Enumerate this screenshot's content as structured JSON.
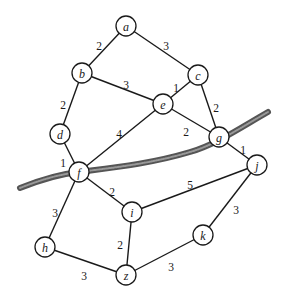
{
  "diagram": {
    "type": "weighted-undirected-graph",
    "nodes": [
      {
        "id": "a",
        "label": "a",
        "x": 126,
        "y": 26
      },
      {
        "id": "b",
        "label": "b",
        "x": 82,
        "y": 73
      },
      {
        "id": "c",
        "label": "c",
        "x": 198,
        "y": 75
      },
      {
        "id": "d",
        "label": "d",
        "x": 60,
        "y": 134
      },
      {
        "id": "e",
        "label": "e",
        "x": 163,
        "y": 104
      },
      {
        "id": "f",
        "label": "f",
        "x": 79,
        "y": 172
      },
      {
        "id": "g",
        "label": "g",
        "x": 219,
        "y": 137
      },
      {
        "id": "h",
        "label": "h",
        "x": 45,
        "y": 247
      },
      {
        "id": "i",
        "label": "i",
        "x": 132,
        "y": 212
      },
      {
        "id": "j",
        "label": "j",
        "x": 257,
        "y": 165
      },
      {
        "id": "k",
        "label": "k",
        "x": 203,
        "y": 235
      },
      {
        "id": "z",
        "label": "z",
        "x": 126,
        "y": 275
      }
    ],
    "edges": [
      {
        "from": "a",
        "to": "b",
        "weight": "2",
        "lx": 99,
        "ly": 46
      },
      {
        "from": "a",
        "to": "c",
        "weight": "3",
        "lx": 166,
        "ly": 46
      },
      {
        "from": "b",
        "to": "e",
        "weight": "3",
        "lx": 126,
        "ly": 85
      },
      {
        "from": "b",
        "to": "d",
        "weight": "2",
        "lx": 63,
        "ly": 105
      },
      {
        "from": "c",
        "to": "e",
        "weight": "1",
        "lx": 176,
        "ly": 88
      },
      {
        "from": "c",
        "to": "g",
        "weight": "2",
        "lx": 216,
        "ly": 108
      },
      {
        "from": "e",
        "to": "g",
        "weight": "2",
        "lx": 186,
        "ly": 132
      },
      {
        "from": "e",
        "to": "f",
        "weight": "4",
        "lx": 119,
        "ly": 134
      },
      {
        "from": "d",
        "to": "f",
        "weight": "1",
        "lx": 63,
        "ly": 163
      },
      {
        "from": "g",
        "to": "j",
        "weight": "1",
        "lx": 243,
        "ly": 150
      },
      {
        "from": "f",
        "to": "i",
        "weight": "2",
        "lx": 112,
        "ly": 192
      },
      {
        "from": "i",
        "to": "j",
        "weight": "5",
        "lx": 190,
        "ly": 185
      },
      {
        "from": "f",
        "to": "h",
        "weight": "3",
        "lx": 55,
        "ly": 213
      },
      {
        "from": "i",
        "to": "z",
        "weight": "2",
        "lx": 120,
        "ly": 245
      },
      {
        "from": "j",
        "to": "k",
        "weight": "3",
        "lx": 236,
        "ly": 210
      },
      {
        "from": "h",
        "to": "z",
        "weight": "3",
        "lx": 84,
        "ly": 276
      },
      {
        "from": "k",
        "to": "z",
        "weight": "3",
        "lx": 171,
        "ly": 267
      }
    ],
    "cut": {
      "path": "M 20 188 C 40 180, 60 174, 79 172 C 110 168, 150 164, 190 152 C 215 145, 240 128, 268 112"
    }
  }
}
